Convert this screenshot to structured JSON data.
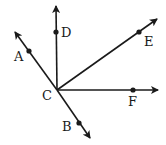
{
  "diagram": {
    "type": "geometry-rays",
    "vertex": {
      "label": "C",
      "x": 57,
      "y": 90,
      "label_x": 42,
      "label_y": 100
    },
    "rays": [
      {
        "name": "ray-CA",
        "tip": [
          15,
          32
        ],
        "point": {
          "label": "A",
          "x": 29,
          "y": 51,
          "label_x": 14,
          "label_y": 61
        }
      },
      {
        "name": "ray-CD",
        "tip": [
          56,
          6
        ],
        "point": {
          "label": "D",
          "x": 56,
          "y": 32,
          "label_x": 61,
          "label_y": 37
        }
      },
      {
        "name": "ray-CE",
        "tip": [
          157,
          19
        ],
        "point": {
          "label": "E",
          "x": 139,
          "y": 32,
          "label_x": 144,
          "label_y": 46
        }
      },
      {
        "name": "ray-CF",
        "tip": [
          158,
          90
        ],
        "point": {
          "label": "F",
          "x": 133,
          "y": 90,
          "label_x": 128,
          "label_y": 106
        }
      },
      {
        "name": "ray-CB",
        "tip": [
          90,
          138
        ],
        "point": {
          "label": "B",
          "x": 79,
          "y": 123,
          "label_x": 62,
          "label_y": 131
        }
      }
    ],
    "colors": {
      "stroke": "#1a1a1a",
      "background": "#ffffff"
    }
  }
}
